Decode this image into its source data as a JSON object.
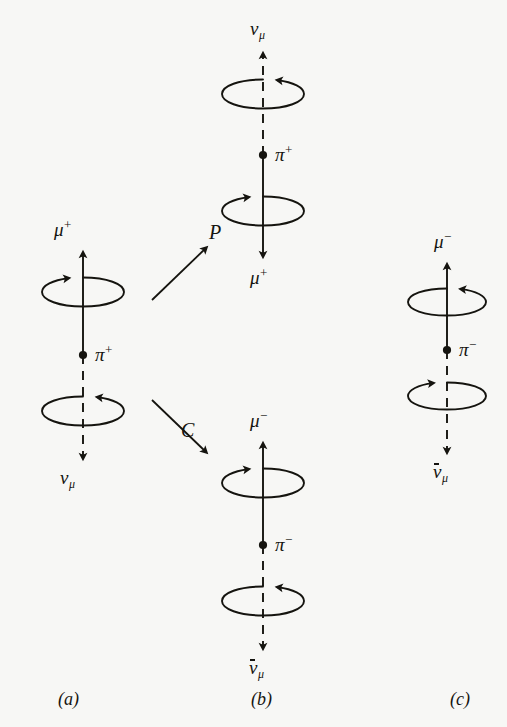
{
  "figure": {
    "background_color": "#f7f7f5",
    "ink_color": "#15140f"
  },
  "operators": [
    {
      "name": "parity",
      "symbol": "P"
    },
    {
      "name": "charge-conjugation",
      "symbol": "C"
    }
  ],
  "captions": {
    "a": "(a)",
    "b": "(b)",
    "c": "(c)"
  },
  "panels": {
    "a": {
      "caption": "(a)",
      "center_particle": {
        "base": "π",
        "charge": "+"
      },
      "top": {
        "particle": {
          "base": "μ",
          "charge": "+",
          "subscript": "",
          "antiparticle": false
        },
        "momentum": "up",
        "line_style": "solid",
        "spin_sense": "counterclockwise-from-above",
        "arrowhead_side": "left"
      },
      "bottom": {
        "particle": {
          "base": "ν",
          "charge": "",
          "subscript": "μ",
          "antiparticle": false
        },
        "momentum": "down",
        "line_style": "dashed",
        "spin_sense": "counterclockwise-from-above",
        "arrowhead_side": "right"
      }
    },
    "b_top": {
      "caption": "(b)",
      "center_particle": {
        "base": "π",
        "charge": "+"
      },
      "top": {
        "particle": {
          "base": "ν",
          "charge": "",
          "subscript": "μ",
          "antiparticle": false
        },
        "momentum": "up",
        "line_style": "dashed",
        "spin_sense": "clockwise-from-above",
        "arrowhead_side": "right"
      },
      "bottom": {
        "particle": {
          "base": "μ",
          "charge": "+",
          "subscript": "",
          "antiparticle": false
        },
        "momentum": "down",
        "line_style": "solid",
        "spin_sense": "clockwise-from-above",
        "arrowhead_side": "left"
      }
    },
    "b_bottom": {
      "caption": "(b)",
      "center_particle": {
        "base": "π",
        "charge": "−"
      },
      "top": {
        "particle": {
          "base": "μ",
          "charge": "−",
          "subscript": "",
          "antiparticle": false
        },
        "momentum": "up",
        "line_style": "solid",
        "spin_sense": "counterclockwise-from-above",
        "arrowhead_side": "left"
      },
      "bottom": {
        "particle": {
          "base": "ν",
          "charge": "",
          "subscript": "μ",
          "antiparticle": true
        },
        "momentum": "down",
        "line_style": "dashed",
        "spin_sense": "counterclockwise-from-above",
        "arrowhead_side": "right"
      }
    },
    "c": {
      "caption": "(c)",
      "center_particle": {
        "base": "π",
        "charge": "−"
      },
      "top": {
        "particle": {
          "base": "μ",
          "charge": "−",
          "subscript": "",
          "antiparticle": false
        },
        "momentum": "up",
        "line_style": "solid",
        "spin_sense": "counterclockwise-from-above",
        "arrowhead_side": "right"
      },
      "bottom": {
        "particle": {
          "base": "ν",
          "charge": "",
          "subscript": "μ",
          "antiparticle": true
        },
        "momentum": "down",
        "line_style": "dashed",
        "spin_sense": "counterclockwise-from-above",
        "arrowhead_side": "left"
      }
    }
  },
  "labels": {
    "a_top": "μ",
    "a_top_sup": "+",
    "a_center": "π",
    "a_center_sup": "+",
    "a_bottom": "ν",
    "a_bottom_sub": "μ",
    "btop_top": "ν",
    "btop_top_sub": "μ",
    "btop_center": "π",
    "btop_center_sup": "+",
    "btop_bottom": "μ",
    "btop_bottom_sup": "+",
    "bbot_top": "μ",
    "bbot_top_sup": "−",
    "bbot_center": "π",
    "bbot_center_sup": "−",
    "bbot_bottom": "ν",
    "bbot_bottom_sub": "μ",
    "c_top": "μ",
    "c_top_sup": "−",
    "c_center": "π",
    "c_center_sup": "−",
    "c_bottom": "ν",
    "c_bottom_sub": "μ",
    "operator_p": "P",
    "operator_c": "C",
    "caption_a": "(a)",
    "caption_b": "(b)",
    "caption_c": "(c)"
  }
}
